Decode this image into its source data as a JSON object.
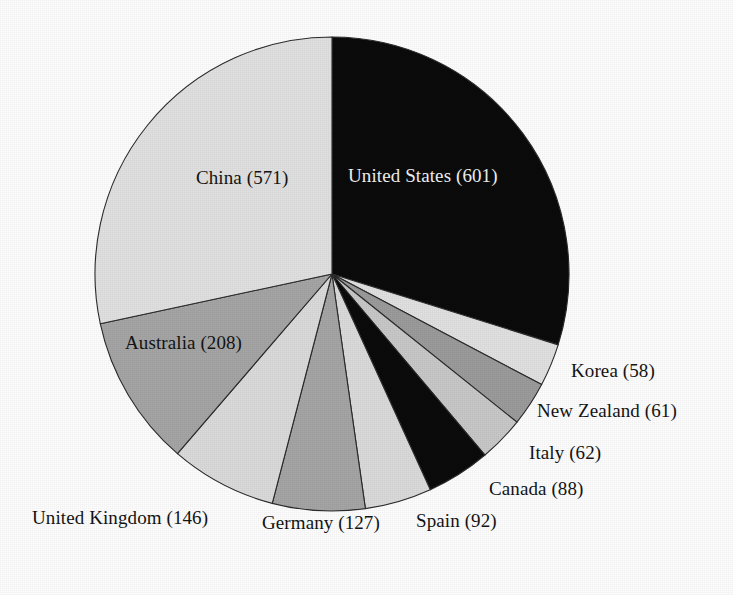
{
  "chart_data": {
    "type": "pie",
    "title": "",
    "subtitle": "",
    "xlabel": "",
    "ylabel": "",
    "legend_position": "none",
    "grid": false,
    "total": 2014,
    "start_angle_deg": 0,
    "direction": "clockwise",
    "categories": [
      "United States",
      "Korea",
      "New Zealand",
      "Italy",
      "Canada",
      "Spain",
      "Germany",
      "United Kingdom",
      "Australia",
      "China"
    ],
    "values": [
      601,
      58,
      61,
      62,
      88,
      92,
      127,
      146,
      208,
      571
    ],
    "slices": [
      {
        "label": "United States (601)",
        "name": "United States",
        "value": 601,
        "percent": 29.8,
        "start_deg": 0.0,
        "end_deg": 107.4,
        "fill": "#0b0b0b",
        "label_placement": "inside",
        "label_color": "#f2f2f2",
        "label_x": 348,
        "label_y": 166
      },
      {
        "label": "Korea (58)",
        "name": "Korea",
        "value": 58,
        "percent": 2.9,
        "start_deg": 107.4,
        "end_deg": 117.8,
        "fill": "#e2e2e2",
        "label_placement": "outside",
        "label_color": "#141414",
        "label_x": 571,
        "label_y": 361
      },
      {
        "label": "New Zealand (61)",
        "name": "New Zealand",
        "value": 61,
        "percent": 3.0,
        "start_deg": 117.8,
        "end_deg": 128.7,
        "fill": "#9c9c9c",
        "label_placement": "outside",
        "label_color": "#141414",
        "label_x": 537,
        "label_y": 401
      },
      {
        "label": "Italy (62)",
        "name": "Italy",
        "value": 62,
        "percent": 3.1,
        "start_deg": 128.7,
        "end_deg": 139.8,
        "fill": "#c9c9c9",
        "label_placement": "outside",
        "label_color": "#141414",
        "label_x": 529,
        "label_y": 443
      },
      {
        "label": "Canada (88)",
        "name": "Canada",
        "value": 88,
        "percent": 4.4,
        "start_deg": 139.8,
        "end_deg": 155.5,
        "fill": "#0b0b0b",
        "label_placement": "outside",
        "label_color": "#141414",
        "label_x": 489,
        "label_y": 479
      },
      {
        "label": "Spain (92)",
        "name": "Spain",
        "value": 92,
        "percent": 4.6,
        "start_deg": 155.5,
        "end_deg": 171.9,
        "fill": "#dcdcdc",
        "label_placement": "outside",
        "label_color": "#141414",
        "label_x": 416,
        "label_y": 511
      },
      {
        "label": "Germany (127)",
        "name": "Germany",
        "value": 127,
        "percent": 6.3,
        "start_deg": 171.9,
        "end_deg": 194.6,
        "fill": "#a6a6a6",
        "label_placement": "outside",
        "label_color": "#141414",
        "label_x": 262,
        "label_y": 513
      },
      {
        "label": "United Kingdom (146)",
        "name": "United Kingdom",
        "value": 146,
        "percent": 7.2,
        "start_deg": 194.6,
        "end_deg": 220.7,
        "fill": "#dcdcdc",
        "label_placement": "outside",
        "label_color": "#141414",
        "label_x": 32,
        "label_y": 508
      },
      {
        "label": "Australia (208)",
        "name": "Australia",
        "value": 208,
        "percent": 10.3,
        "start_deg": 220.7,
        "end_deg": 257.9,
        "fill": "#a6a6a6",
        "label_placement": "inside",
        "label_color": "#141414",
        "label_x": 125,
        "label_y": 333
      },
      {
        "label": "China (571)",
        "name": "China",
        "value": 571,
        "percent": 28.4,
        "start_deg": 257.9,
        "end_deg": 360.0,
        "fill": "#e2e2e2",
        "label_placement": "inside",
        "label_color": "#141414",
        "label_x": 196,
        "label_y": 168
      }
    ],
    "geometry": {
      "center_x": 332,
      "center_y": 274,
      "radius": 237
    }
  }
}
